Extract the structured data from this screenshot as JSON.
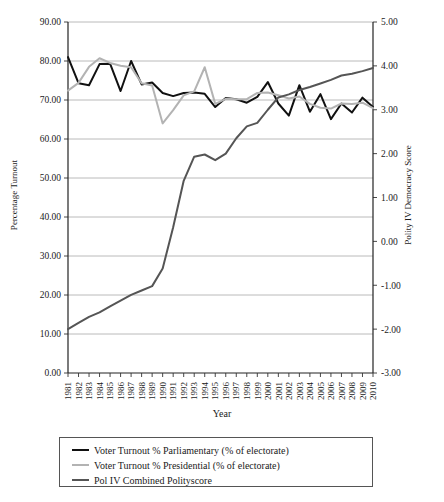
{
  "chart_data": {
    "type": "line",
    "title": "",
    "xlabel": "Year",
    "ylabel": "Percentage Turnout",
    "ylabel_secondary": "Polity IV Democracy Score",
    "grid": true,
    "legend_position": "bottom",
    "x": [
      1981,
      1982,
      1983,
      1984,
      1985,
      1986,
      1987,
      1988,
      1989,
      1990,
      1991,
      1992,
      1993,
      1994,
      1995,
      1996,
      1997,
      1998,
      1999,
      2000,
      2001,
      2002,
      2003,
      2004,
      2005,
      2006,
      2007,
      2008,
      2009,
      2010
    ],
    "xtick_labels": [
      "1981",
      "1982",
      "1983",
      "1984",
      "1985",
      "1986",
      "1987",
      "1988",
      "1989",
      "1990",
      "1991",
      "1992",
      "1993",
      "1994",
      "1995",
      "1996",
      "1997",
      "1998",
      "1999",
      "2000",
      "2001",
      "2002",
      "2003",
      "2004",
      "2005",
      "2006",
      "2007",
      "2008",
      "2009",
      "2010"
    ],
    "ylim": [
      0.0,
      90.0
    ],
    "ytick_labels": [
      "0.00",
      "10.00",
      "20.00",
      "30.00",
      "40.00",
      "50.00",
      "60.00",
      "70.00",
      "80.00",
      "90.00"
    ],
    "ytick_values": [
      0,
      10,
      20,
      30,
      40,
      50,
      60,
      70,
      80,
      90
    ],
    "ylim_secondary": [
      -3.0,
      5.0
    ],
    "ytick_labels_secondary": [
      "-3.00",
      "-2.00",
      "-1.00",
      "0.00",
      "1.00",
      "2.00",
      "3.00",
      "4.00",
      "5.00"
    ],
    "ytick_values_secondary": [
      -3,
      -2,
      -1,
      0,
      1,
      2,
      3,
      4,
      5
    ],
    "series": [
      {
        "name": "Voter Turnout % Parliamentary (% of electorate)",
        "axis": "left",
        "color": "#111111",
        "width": 2.0,
        "values": [
          81.0,
          74.3,
          73.8,
          79.2,
          79.3,
          72.3,
          80.0,
          74.0,
          74.5,
          71.8,
          71.0,
          71.8,
          71.9,
          71.6,
          68.2,
          70.5,
          70.2,
          69.3,
          70.8,
          74.6,
          69.1,
          66.0,
          73.8,
          67.0,
          71.5,
          65.1,
          69.1,
          66.8,
          70.6,
          68.2
        ]
      },
      {
        "name": "Voter Turnout % Presidential (% of electorate)",
        "axis": "left",
        "color": "#b3b3b3",
        "width": 2.0,
        "values": [
          72.4,
          74.4,
          78.5,
          80.7,
          79.5,
          78.8,
          78.4,
          74.3,
          73.7,
          64.0,
          67.4,
          71.2,
          72.2,
          78.4,
          69.0,
          70.3,
          70.2,
          70.2,
          71.8,
          71.9,
          71.2,
          70.4,
          70.9,
          69.0,
          68.0,
          67.8,
          69.1,
          69.0,
          69.3,
          67.9
        ]
      },
      {
        "name": "Pol IV Combined Polityscore",
        "axis": "right",
        "color": "#555555",
        "width": 2.0,
        "values": [
          -2.0,
          -1.86,
          -1.72,
          -1.62,
          -1.48,
          -1.35,
          -1.22,
          -1.12,
          -1.02,
          -0.62,
          0.32,
          1.38,
          1.93,
          1.98,
          1.85,
          2.0,
          2.35,
          2.62,
          2.7,
          3.0,
          3.28,
          3.35,
          3.45,
          3.52,
          3.6,
          3.68,
          3.78,
          3.82,
          3.88,
          3.95
        ]
      }
    ]
  },
  "legend": {
    "entries": [
      {
        "label": "Voter Turnout % Parliamentary (% of electorate)",
        "color": "#111111",
        "thickness": "2px"
      },
      {
        "label": "Voter Turnout % Presidential (% of electorate)",
        "color": "#b3b3b3",
        "thickness": "2px"
      },
      {
        "label": "Pol IV Combined Polityscore",
        "color": "#555555",
        "thickness": "2px"
      }
    ]
  }
}
